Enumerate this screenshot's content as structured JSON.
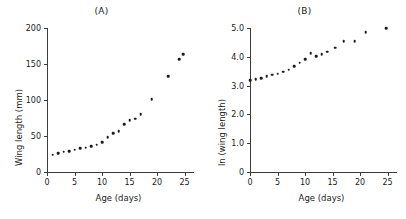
{
  "figure": {
    "background": "#ffffff",
    "point_color": "#1a1a1a",
    "axis_color": "#3c3c3c"
  },
  "panels": [
    {
      "id": "a",
      "label": "(A)"
    },
    {
      "id": "b",
      "label": "(B)"
    }
  ],
  "chart_data": [
    {
      "type": "scatter",
      "title": "(A)",
      "xlabel": "Age (days)",
      "ylabel": "Wing length (mm)",
      "xlim": [
        0,
        26
      ],
      "ylim": [
        0,
        200
      ],
      "xticks": [
        0,
        5,
        10,
        15,
        20,
        25
      ],
      "xticklabels": [
        "0",
        "5",
        "10",
        "15",
        "20",
        "25"
      ],
      "yticks": [
        0,
        50,
        100,
        150,
        200
      ],
      "yticklabels": [
        "0",
        "50",
        "100",
        "150",
        "200"
      ],
      "grid": false,
      "legend": false,
      "x": [
        1.0,
        2.0,
        3.0,
        4.0,
        5.0,
        6.0,
        7.0,
        8.0,
        9.0,
        10.0,
        11.0,
        12.0,
        13.0,
        14.0,
        15.0,
        16.0,
        17.0,
        19.0,
        22.0,
        24.0,
        24.8
      ],
      "y": [
        24,
        26,
        28,
        29,
        31,
        33,
        34,
        36,
        38,
        41,
        48,
        54,
        57,
        66,
        72,
        74,
        80,
        101,
        133,
        157,
        164
      ]
    },
    {
      "type": "scatter",
      "title": "(B)",
      "xlabel": "Age (days)",
      "ylabel": "ln (wing length)",
      "xlim": [
        0,
        26
      ],
      "ylim": [
        0,
        5.0
      ],
      "xticks": [
        0,
        5,
        10,
        15,
        20,
        25
      ],
      "xticklabels": [
        "0",
        "5",
        "10",
        "15",
        "20",
        "25"
      ],
      "yticks": [
        0,
        1.0,
        2.0,
        3.0,
        4.0,
        5.0
      ],
      "yticklabels": [
        "0",
        "1.0",
        "2.0",
        "3.0",
        "4.0",
        "5.0"
      ],
      "grid": false,
      "legend": false,
      "x": [
        0.0,
        1.0,
        2.0,
        3.0,
        4.0,
        5.0,
        6.0,
        7.0,
        8.0,
        9.0,
        10.0,
        11.0,
        12.0,
        13.0,
        14.0,
        15.5,
        17.0,
        19.0,
        21.0,
        24.8
      ],
      "y": [
        3.18,
        3.22,
        3.26,
        3.32,
        3.38,
        3.42,
        3.48,
        3.55,
        3.68,
        3.79,
        3.91,
        4.13,
        4.03,
        4.1,
        4.17,
        4.32,
        4.54,
        4.55,
        4.86,
        5.0
      ]
    }
  ]
}
